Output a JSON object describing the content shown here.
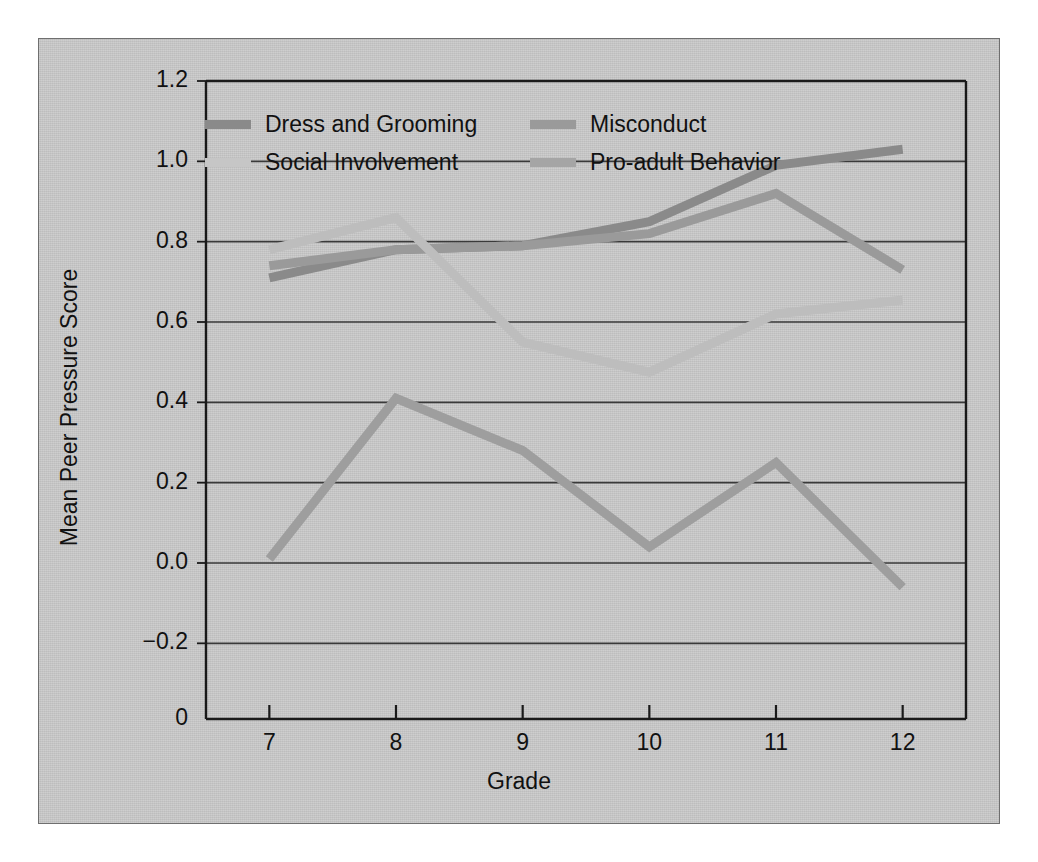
{
  "chart_data": {
    "type": "line",
    "title": "",
    "xlabel": "Grade",
    "ylabel": "Mean Peer Pressure Score",
    "categories": [
      "7",
      "8",
      "9",
      "10",
      "11",
      "12"
    ],
    "x": [
      7,
      8,
      9,
      10,
      11,
      12
    ],
    "xlim": [
      6.5,
      12.5
    ],
    "ylim": [
      -0.3,
      1.2
    ],
    "yticks": [
      "1.2",
      "1.0",
      "0.8",
      "0.6",
      "0.4",
      "0.2",
      "0.0",
      "−0.2",
      "0"
    ],
    "ytick_values": [
      1.2,
      1.0,
      0.8,
      0.6,
      0.4,
      0.2,
      0.0,
      -0.2,
      -0.3
    ],
    "grid": true,
    "grid_axis": "y",
    "legend_position": "top-inside",
    "series": [
      {
        "name": "Dress and Grooming",
        "color": "#8a8a8a",
        "values": [
          0.71,
          0.78,
          0.79,
          0.85,
          0.99,
          1.03
        ]
      },
      {
        "name": "Misconduct",
        "color": "#9a9a9a",
        "values": [
          0.74,
          0.78,
          0.79,
          0.82,
          0.92,
          0.73
        ]
      },
      {
        "name": "Social Involvement",
        "color": "#bdbdbd",
        "values": [
          0.78,
          0.86,
          0.55,
          0.475,
          0.62,
          0.655
        ]
      },
      {
        "name": "Pro-adult Behavior",
        "color": "#9e9e9e",
        "values": [
          0.01,
          0.41,
          0.28,
          0.04,
          0.25,
          -0.06
        ]
      }
    ]
  },
  "legend": {
    "entries": [
      {
        "label": "Dress and Grooming",
        "swatch_color": "#8a8a8a"
      },
      {
        "label": "Misconduct",
        "swatch_color": "#9a9a9a"
      },
      {
        "label": "Social Involvement",
        "swatch_color": "#c6c6c6"
      },
      {
        "label": "Pro-adult Behavior",
        "swatch_color": "#a5a5a5"
      }
    ]
  },
  "axes": {
    "y_title": "Mean Peer Pressure Score",
    "x_title": "Grade",
    "y_labels": [
      "1.2",
      "1.0",
      "0.8",
      "0.6",
      "0.4",
      "0.2",
      "0.0",
      "−0.2",
      "0"
    ],
    "x_labels": [
      "7",
      "8",
      "9",
      "10",
      "11",
      "12"
    ]
  },
  "style": {
    "panel_background": "#c9c9c9",
    "panel_border": "#6f6f6f",
    "axis_color": "#1a1a1a",
    "grid_color": "#3a3a3a",
    "page_background": "#ffffff",
    "text_color": "#111111"
  }
}
